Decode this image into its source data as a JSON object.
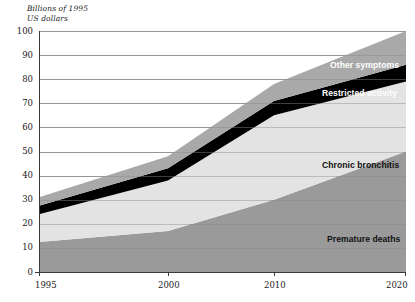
{
  "chart_data": {
    "type": "area",
    "stacked": true,
    "title": "",
    "subtitle": "",
    "ylabel": "Billions of 1995\nUS dollars",
    "xlabel": "",
    "grid": true,
    "legend_position": "inline-right",
    "x": [
      1995,
      2000,
      2010,
      2020
    ],
    "x_tick_labels": [
      "1995",
      "2000",
      "2010",
      "2020"
    ],
    "y_tick_labels": [
      "0",
      "10",
      "20",
      "30",
      "40",
      "50",
      "60",
      "70",
      "80",
      "90",
      "100"
    ],
    "y_ticks": [
      0,
      10,
      20,
      30,
      40,
      50,
      60,
      70,
      80,
      90,
      100
    ],
    "ylim": [
      0,
      100
    ],
    "xlim": [
      1995,
      2020
    ],
    "series": [
      {
        "name": "Premature deaths",
        "color": "#9a9a9a",
        "label_color": "#111111",
        "values": [
          12.5,
          17.0,
          30.0,
          50.0
        ]
      },
      {
        "name": "Chronic bronchitis",
        "color": "#e3e3e3",
        "label_color": "#111111",
        "values": [
          11.5,
          21.0,
          35.0,
          29.0
        ]
      },
      {
        "name": "Restricted activity",
        "color": "#000000",
        "label_color": "#ffffff",
        "values": [
          3.5,
          5.0,
          6.0,
          7.0
        ]
      },
      {
        "name": "Other symptoms",
        "color": "#a9a9a9",
        "label_color": "#111111",
        "values": [
          3.5,
          5.0,
          7.0,
          14.0
        ]
      }
    ],
    "cumulative_tops": {
      "premature_deaths": [
        12.5,
        17.0,
        30.0,
        50.0
      ],
      "chronic_bronchitis": [
        24.0,
        38.0,
        65.0,
        79.0
      ],
      "restricted_activity": [
        27.5,
        43.0,
        71.0,
        86.0
      ],
      "other_symptoms": [
        31.0,
        48.0,
        78.0,
        100.0
      ]
    },
    "annotations": [
      {
        "text": "Other symptoms",
        "series": "Other symptoms",
        "x_px": 330,
        "y_px": 60,
        "on": "dark"
      },
      {
        "text": "Restricted activity",
        "series": "Restricted activity",
        "x_px": 322,
        "y_px": 88,
        "on": "dark"
      },
      {
        "text": "Chronic bronchitis",
        "series": "Chronic bronchitis",
        "x_px": 322,
        "y_px": 160,
        "on": "light"
      },
      {
        "text": "Premature deaths",
        "series": "Premature deaths",
        "x_px": 327,
        "y_px": 234,
        "on": "light"
      }
    ]
  },
  "axis": {
    "y_title": "Billions of 1995\nUS dollars",
    "y_ticks": [
      "100",
      "90",
      "80",
      "70",
      "60",
      "50",
      "40",
      "30",
      "20",
      "10",
      "0"
    ],
    "x_ticks": [
      "1995",
      "2000",
      "2010",
      "2020"
    ]
  },
  "colors": {
    "grid": "#8a8a8a",
    "axis": "#3a3a3a",
    "premature_deaths": "#9a9a9a",
    "chronic_bronchitis": "#e3e3e3",
    "restricted_activity": "#000000",
    "other_symptoms": "#a9a9a9",
    "background": "#ffffff",
    "text": "#1a1a1a"
  },
  "labels": {
    "other_symptoms": "Other symptoms",
    "restricted_activity": "Restricted activity",
    "chronic_bronchitis": "Chronic bronchitis",
    "premature_deaths": "Premature deaths"
  }
}
